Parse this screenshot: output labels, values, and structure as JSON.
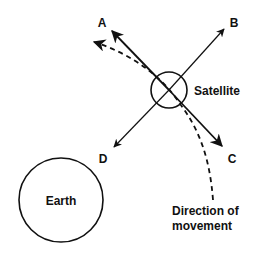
{
  "diagram": {
    "labels": {
      "a": "A",
      "b": "B",
      "c": "C",
      "d": "D",
      "satellite": "Satellite",
      "earth": "Earth",
      "direction_line1": "Direction of",
      "direction_line2": "movement"
    },
    "colors": {
      "stroke": "#111111",
      "background": "#ffffff"
    }
  }
}
